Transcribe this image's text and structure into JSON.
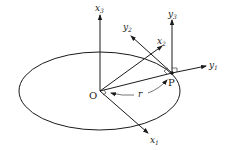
{
  "diagram": {
    "origin_label": "O",
    "point_label": "P",
    "radius_label": "r",
    "inertial_axes": [
      {
        "name": "x",
        "index": "1"
      },
      {
        "name": "x",
        "index": "2"
      },
      {
        "name": "x",
        "index": "3"
      }
    ],
    "rotating_axes": [
      {
        "name": "y",
        "index": "1"
      },
      {
        "name": "y",
        "index": "2"
      },
      {
        "name": "y",
        "index": "3"
      }
    ],
    "colors": {
      "ink": "#1a1a1a",
      "background": "#ffffff"
    }
  }
}
